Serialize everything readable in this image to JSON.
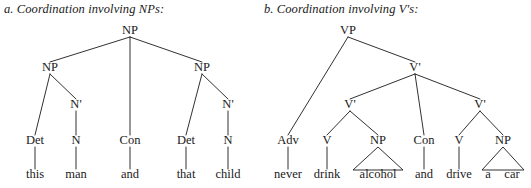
{
  "figure": {
    "caption_a": "a. Coordination involving NPs:",
    "caption_b": "b. Coordination involving V's:",
    "ink_color": "#1a1a1a",
    "background_color": "#ffffff"
  },
  "tree_a": {
    "id": "np-coordination-tree",
    "root_label": "NP",
    "nodes": [
      {
        "id": "a-np-root",
        "label": "NP",
        "x": 130,
        "y": 34
      },
      {
        "id": "a-np-left",
        "label": "NP",
        "x": 50,
        "y": 71
      },
      {
        "id": "a-np-right",
        "label": "NP",
        "x": 202,
        "y": 71
      },
      {
        "id": "a-nbar-1",
        "label": "N'",
        "x": 76,
        "y": 108
      },
      {
        "id": "a-nbar-2",
        "label": "N'",
        "x": 228,
        "y": 108
      },
      {
        "id": "a-det-1",
        "label": "Det",
        "x": 35,
        "y": 144
      },
      {
        "id": "a-n-1",
        "label": "N",
        "x": 76,
        "y": 144
      },
      {
        "id": "a-con",
        "label": "Con",
        "x": 130,
        "y": 144
      },
      {
        "id": "a-det-2",
        "label": "Det",
        "x": 186,
        "y": 144
      },
      {
        "id": "a-n-2",
        "label": "N",
        "x": 228,
        "y": 144
      },
      {
        "id": "a-w-this",
        "label": "this",
        "x": 35,
        "y": 178
      },
      {
        "id": "a-w-man",
        "label": "man",
        "x": 76,
        "y": 178
      },
      {
        "id": "a-w-and",
        "label": "and",
        "x": 130,
        "y": 178
      },
      {
        "id": "a-w-that",
        "label": "that",
        "x": 186,
        "y": 178
      },
      {
        "id": "a-w-child",
        "label": "child",
        "x": 228,
        "y": 178
      }
    ],
    "edges": [
      {
        "from": "a-np-root",
        "to": "a-np-left"
      },
      {
        "from": "a-np-root",
        "to": "a-con"
      },
      {
        "from": "a-np-root",
        "to": "a-np-right"
      },
      {
        "from": "a-np-left",
        "to": "a-det-1"
      },
      {
        "from": "a-np-left",
        "to": "a-nbar-1"
      },
      {
        "from": "a-nbar-1",
        "to": "a-n-1"
      },
      {
        "from": "a-np-right",
        "to": "a-det-2"
      },
      {
        "from": "a-np-right",
        "to": "a-nbar-2"
      },
      {
        "from": "a-nbar-2",
        "to": "a-n-2"
      },
      {
        "from": "a-det-1",
        "to": "a-w-this"
      },
      {
        "from": "a-n-1",
        "to": "a-w-man"
      },
      {
        "from": "a-con",
        "to": "a-w-and"
      },
      {
        "from": "a-det-2",
        "to": "a-w-that"
      },
      {
        "from": "a-n-2",
        "to": "a-w-child"
      }
    ],
    "triangles": []
  },
  "tree_b": {
    "id": "vbar-coordination-tree",
    "root_label": "VP",
    "nodes": [
      {
        "id": "b-vp",
        "label": "VP",
        "x": 348,
        "y": 34
      },
      {
        "id": "b-vbar-top",
        "label": "V'",
        "x": 415,
        "y": 71
      },
      {
        "id": "b-vbar-l",
        "label": "V'",
        "x": 350,
        "y": 108
      },
      {
        "id": "b-vbar-r",
        "label": "V'",
        "x": 480,
        "y": 108
      },
      {
        "id": "b-adv",
        "label": "Adv",
        "x": 288,
        "y": 144
      },
      {
        "id": "b-v-1",
        "label": "V",
        "x": 327,
        "y": 144
      },
      {
        "id": "b-np-1",
        "label": "NP",
        "x": 378,
        "y": 144
      },
      {
        "id": "b-con",
        "label": "Con",
        "x": 424,
        "y": 144
      },
      {
        "id": "b-v-2",
        "label": "V",
        "x": 459,
        "y": 144
      },
      {
        "id": "b-np-2",
        "label": "NP",
        "x": 503,
        "y": 144
      },
      {
        "id": "b-w-never",
        "label": "never",
        "x": 288,
        "y": 178
      },
      {
        "id": "b-w-drink",
        "label": "drink",
        "x": 327,
        "y": 178
      },
      {
        "id": "b-w-alcohol",
        "label": "alcohol",
        "x": 378,
        "y": 178
      },
      {
        "id": "b-w-and",
        "label": "and",
        "x": 424,
        "y": 178
      },
      {
        "id": "b-w-drive",
        "label": "drive",
        "x": 459,
        "y": 178
      },
      {
        "id": "b-w-a",
        "label": "a",
        "x": 488,
        "y": 178
      },
      {
        "id": "b-w-car",
        "label": "car",
        "x": 512,
        "y": 178
      }
    ],
    "edges": [
      {
        "from": "b-vp",
        "to": "b-adv"
      },
      {
        "from": "b-vp",
        "to": "b-vbar-top"
      },
      {
        "from": "b-vbar-top",
        "to": "b-vbar-l"
      },
      {
        "from": "b-vbar-top",
        "to": "b-con"
      },
      {
        "from": "b-vbar-top",
        "to": "b-vbar-r"
      },
      {
        "from": "b-vbar-l",
        "to": "b-v-1"
      },
      {
        "from": "b-vbar-l",
        "to": "b-np-1"
      },
      {
        "from": "b-vbar-r",
        "to": "b-v-2"
      },
      {
        "from": "b-vbar-r",
        "to": "b-np-2"
      },
      {
        "from": "b-adv",
        "to": "b-w-never"
      },
      {
        "from": "b-v-1",
        "to": "b-w-drink"
      },
      {
        "from": "b-con",
        "to": "b-w-and"
      },
      {
        "from": "b-v-2",
        "to": "b-w-drive"
      }
    ],
    "triangles": [
      {
        "id": "b-triangle-alcohol",
        "from": "b-np-1",
        "left_x": 353,
        "right_x": 403,
        "covers": "alcohol"
      },
      {
        "id": "b-triangle-a-car",
        "from": "b-np-2",
        "left_x": 482,
        "right_x": 524,
        "covers": "a car"
      }
    ]
  }
}
